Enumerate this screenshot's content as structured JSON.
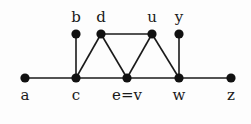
{
  "figure": {
    "type": "graph",
    "nodes": [
      {
        "id": "a",
        "label": "a",
        "x": 25,
        "y": 78,
        "label_pos": "below"
      },
      {
        "id": "c",
        "label": "c",
        "x": 76,
        "y": 78,
        "label_pos": "below"
      },
      {
        "id": "ev",
        "label": "e=v",
        "x": 127,
        "y": 78,
        "label_pos": "below"
      },
      {
        "id": "w",
        "label": "w",
        "x": 179,
        "y": 78,
        "label_pos": "below"
      },
      {
        "id": "z",
        "label": "z",
        "x": 231,
        "y": 78,
        "label_pos": "below"
      },
      {
        "id": "b",
        "label": "b",
        "x": 76,
        "y": 34,
        "label_pos": "above"
      },
      {
        "id": "d",
        "label": "d",
        "x": 101,
        "y": 34,
        "label_pos": "above"
      },
      {
        "id": "u",
        "label": "u",
        "x": 152,
        "y": 34,
        "label_pos": "above"
      },
      {
        "id": "y",
        "label": "y",
        "x": 179,
        "y": 34,
        "label_pos": "above"
      }
    ],
    "edges": [
      [
        "a",
        "c"
      ],
      [
        "c",
        "ev"
      ],
      [
        "ev",
        "w"
      ],
      [
        "w",
        "z"
      ],
      [
        "b",
        "c"
      ],
      [
        "c",
        "d"
      ],
      [
        "d",
        "ev"
      ],
      [
        "d",
        "u"
      ],
      [
        "u",
        "ev"
      ],
      [
        "u",
        "w"
      ],
      [
        "y",
        "w"
      ]
    ]
  }
}
